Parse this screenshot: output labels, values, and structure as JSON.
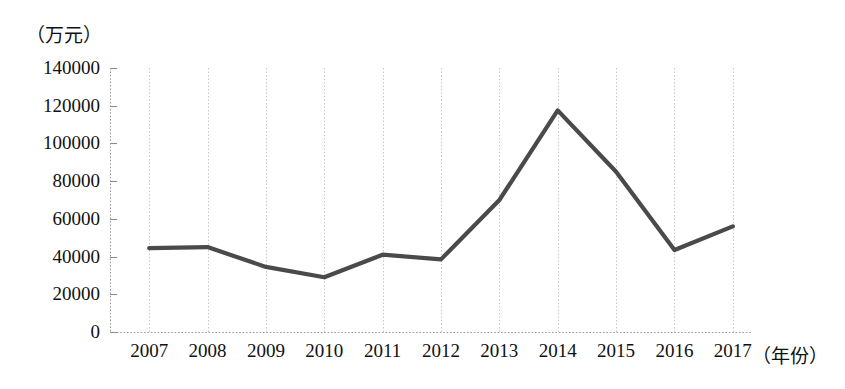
{
  "chart_data": {
    "type": "line",
    "title": "",
    "subtitle": "",
    "xlabel": "（年份）",
    "ylabel": "（万元）",
    "categories": [
      "2007",
      "2008",
      "2009",
      "2010",
      "2011",
      "2012",
      "2013",
      "2014",
      "2015",
      "2016",
      "2017"
    ],
    "values": [
      44500,
      45000,
      34500,
      29000,
      41000,
      38500,
      70000,
      117500,
      85000,
      43500,
      56000
    ],
    "series": [
      {
        "name": "金额",
        "values": [
          44500,
          45000,
          34500,
          29000,
          41000,
          38500,
          70000,
          117500,
          85000,
          43500,
          56000
        ]
      }
    ],
    "ylim": [
      0,
      140000
    ],
    "ytick_labels": [
      "0",
      "20000",
      "40000",
      "60000",
      "80000",
      "100000",
      "120000",
      "140000"
    ],
    "ytick_values": [
      0,
      20000,
      40000,
      60000,
      80000,
      100000,
      120000,
      140000
    ],
    "grid": "dashed-vertical-and-axis",
    "legend": "none",
    "legend_position": "none",
    "line_color": "#4a4a4a",
    "grid_color": "#c9c9c9",
    "axis_color": "#8c8c8c",
    "background_color": "#ffffff"
  },
  "axis": {
    "y_unit": "（万元）",
    "x_unit": "（年份）"
  }
}
